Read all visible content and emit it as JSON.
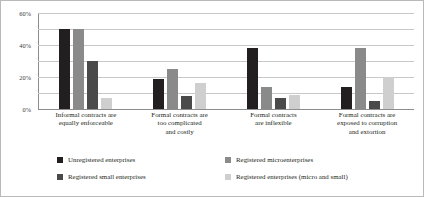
{
  "chart_data": {
    "type": "bar",
    "title": "",
    "xlabel": "",
    "ylabel": "",
    "ylim": [
      0,
      60
    ],
    "yticks": [
      "0%",
      "20%",
      "40%",
      "60%"
    ],
    "ytick_values": [
      0,
      20,
      40,
      60
    ],
    "gridlines": [
      0,
      10,
      20,
      30,
      40,
      50,
      60
    ],
    "grid": true,
    "legend_position": "bottom",
    "categories": [
      "Informal contracts are equally enforceable",
      "Formal contracts are too complicated and costly",
      "Formal contracts are inflexible",
      "Formal contracts are exposed to corruption and extortion"
    ],
    "category_lines": [
      [
        "Informal contracts are",
        "equally enforceable"
      ],
      [
        "Formal contracts are",
        "too complicated",
        "and costly"
      ],
      [
        "Formal contracts",
        "are inflexible"
      ],
      [
        "Formal contracts are",
        "exposed to corruption",
        "and extortion"
      ]
    ],
    "series": [
      {
        "name": "Unregistered enterprises",
        "color": "#231f20",
        "values": [
          50,
          19,
          38,
          14
        ]
      },
      {
        "name": "Registered microenterprises",
        "color": "#8a8a8a",
        "values": [
          50,
          25,
          14,
          38
        ]
      },
      {
        "name": "Registered small enterprises",
        "color": "#4a4a4a",
        "values": [
          30,
          8,
          7,
          5
        ]
      },
      {
        "name": "Registered enterprises (micro and small)",
        "color": "#cfcfcf",
        "values": [
          7,
          16,
          9,
          20
        ]
      }
    ],
    "legend_order": [
      "Unregistered enterprises",
      "Registered microenterprises",
      "Registered small enterprises",
      "Registered enterprises (micro and small)"
    ]
  }
}
